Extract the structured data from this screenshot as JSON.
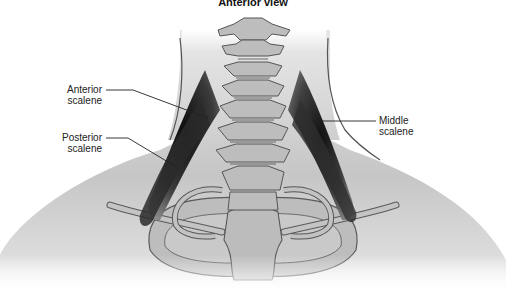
{
  "figure": {
    "title": "Anterior view",
    "labels": {
      "anterior_scalene": {
        "line1": "Anterior",
        "line2": "scalene"
      },
      "posterior_scalene": {
        "line1": "Posterior",
        "line2": "scalene"
      },
      "middle_scalene": {
        "line1": "Middle",
        "line2": "scalene"
      }
    },
    "colors": {
      "skin_fill": "#c8c8c8",
      "skin_fade": "#ffffff",
      "bone_fill": "#b4b4b4",
      "bone_outline": "#555555",
      "muscle_dark": "#1a1a1a",
      "muscle_mid": "#6a6a6a",
      "leader_line": "#222222"
    }
  }
}
